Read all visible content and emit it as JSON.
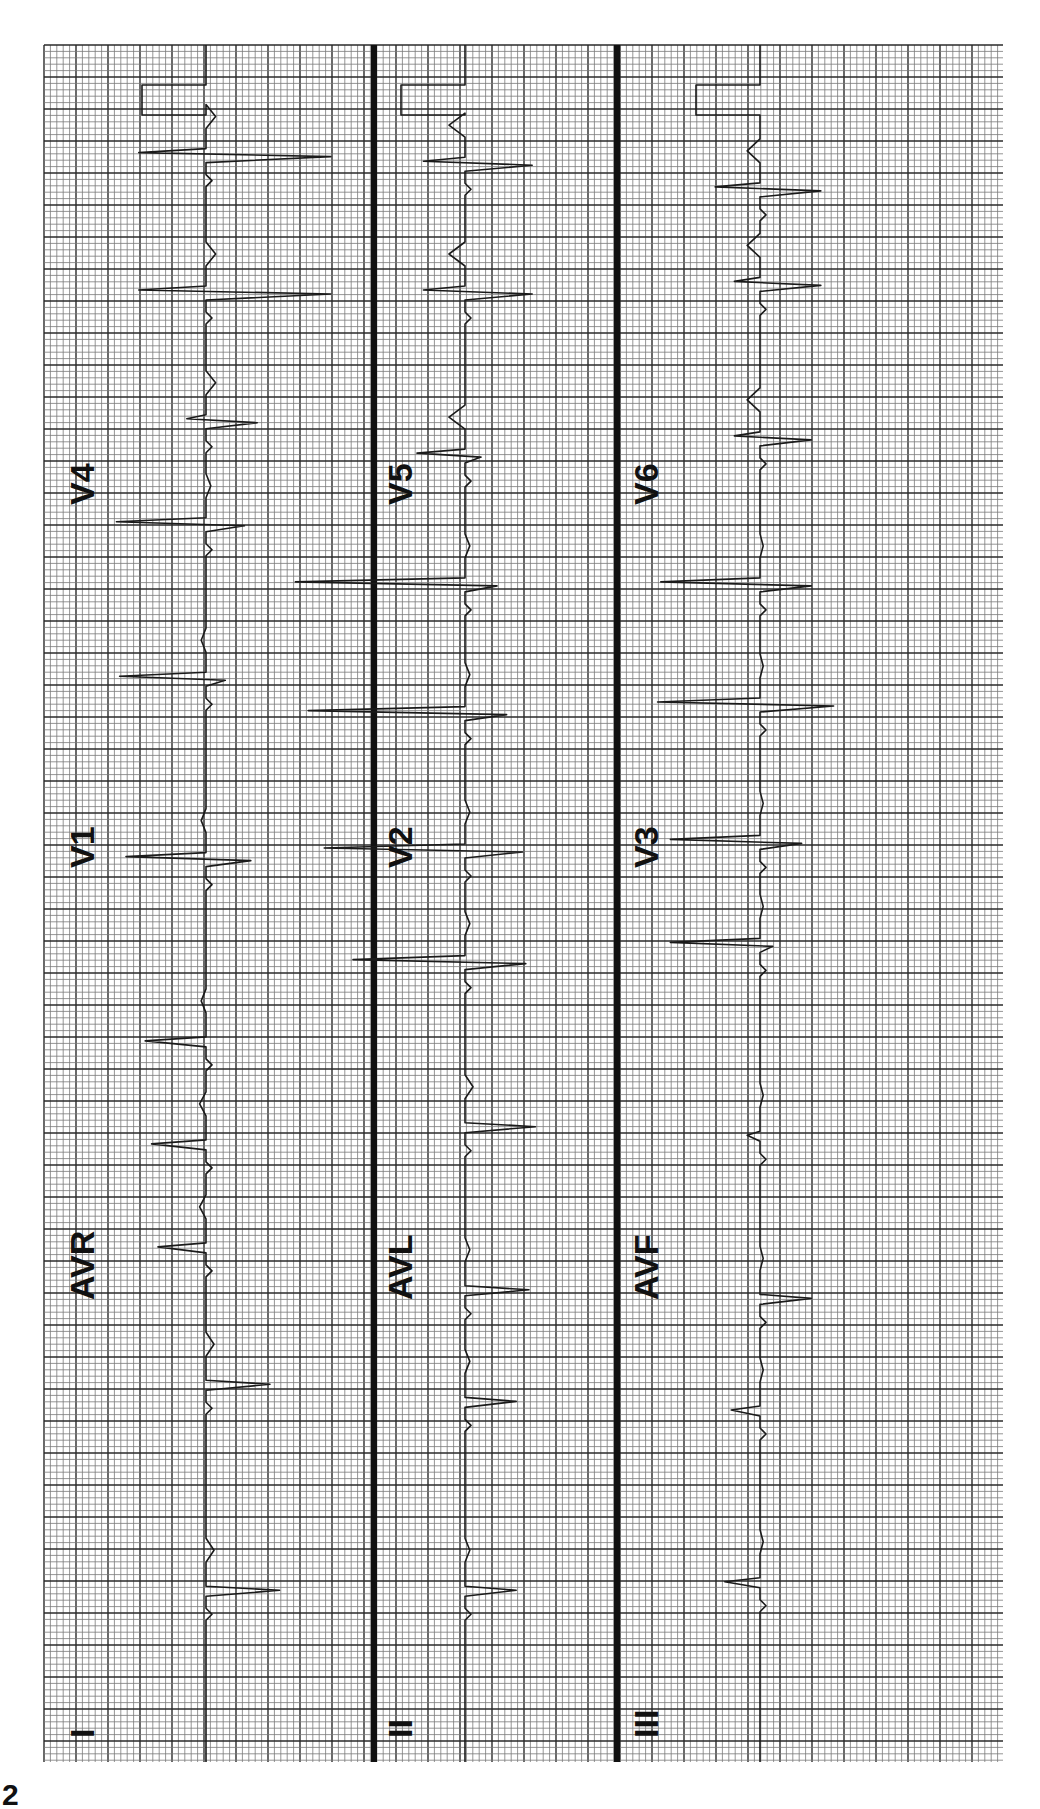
{
  "chart_data": {
    "type": "line",
    "orientation": "rotated 90° counter-clockwise (time runs bottom-to-top)",
    "grid": true,
    "grid_color_minor": "#7a7a7a",
    "grid_color_major": "#2a2a2a",
    "trace_color": "#1a1a1a",
    "divider_color": "#111111",
    "xlabel": "",
    "ylabel": "",
    "time_range_large_boxes": [
      0,
      53
    ],
    "strips": [
      {
        "name": "strip-1",
        "leads": [
          {
            "label": "I",
            "segment": 0
          },
          {
            "label": "AVR",
            "segment": 1
          },
          {
            "label": "V1",
            "segment": 2
          },
          {
            "label": "V4",
            "segment": 3
          }
        ],
        "calibration": {
          "top": true,
          "bottom": true
        },
        "beats": [
          {
            "t": 0.1,
            "r": 2.3,
            "s": 0.0,
            "tw": 0.5
          },
          {
            "t": 0.22,
            "r": 2.0,
            "s": 0.0,
            "tw": 0.5
          },
          {
            "t": 0.3,
            "r": -1.5,
            "s": 0.0,
            "tw": -0.4
          },
          {
            "t": 0.36,
            "r": -1.7,
            "s": 0.0,
            "tw": -0.4
          },
          {
            "t": 0.42,
            "r": -1.9,
            "s": 0.0,
            "tw": -0.3
          },
          {
            "t": 0.525,
            "r": 1.4,
            "s": -2.5,
            "tw": -0.3
          },
          {
            "t": 0.63,
            "r": 0.6,
            "s": -2.7,
            "tw": -0.3
          },
          {
            "t": 0.72,
            "r": 1.2,
            "s": -2.8,
            "tw": 0.3
          },
          {
            "t": 0.78,
            "r": 1.6,
            "s": -0.6,
            "tw": 0.6
          },
          {
            "t": 0.855,
            "r": 3.9,
            "s": -2.1,
            "tw": 0.6
          },
          {
            "t": 0.935,
            "r": 3.9,
            "s": -2.1,
            "tw": 0.6
          }
        ]
      },
      {
        "name": "strip-2",
        "leads": [
          {
            "label": "II",
            "segment": 0
          },
          {
            "label": "AVL",
            "segment": 1
          },
          {
            "label": "V2",
            "segment": 2
          },
          {
            "label": "V5",
            "segment": 3
          }
        ],
        "calibration": {
          "top": true,
          "bottom": true
        },
        "beats": [
          {
            "t": 0.1,
            "r": 1.6,
            "s": 0.0,
            "tw": 0.3
          },
          {
            "t": 0.21,
            "r": 1.6,
            "s": 0.0,
            "tw": 0.3
          },
          {
            "t": 0.275,
            "r": 2.0,
            "s": 0.0,
            "tw": 0.3
          },
          {
            "t": 0.37,
            "r": 2.2,
            "s": 0.0,
            "tw": 0.5
          },
          {
            "t": 0.465,
            "r": 1.9,
            "s": -3.5,
            "tw": 0.3
          },
          {
            "t": 0.53,
            "r": 1.8,
            "s": -4.4,
            "tw": 0.3
          },
          {
            "t": 0.61,
            "r": 1.3,
            "s": -4.9,
            "tw": 0.3
          },
          {
            "t": 0.685,
            "r": 1.0,
            "s": -5.3,
            "tw": 0.3
          },
          {
            "t": 0.76,
            "r": 0.5,
            "s": -1.5,
            "tw": -1.0
          },
          {
            "t": 0.855,
            "r": 2.1,
            "s": -1.3,
            "tw": -1.0
          },
          {
            "t": 0.93,
            "r": 2.1,
            "s": -1.3,
            "tw": -1.0
          }
        ]
      },
      {
        "name": "strip-3",
        "leads": [
          {
            "label": "III",
            "segment": 0
          },
          {
            "label": "AVF",
            "segment": 1
          },
          {
            "label": "V3",
            "segment": 2
          },
          {
            "label": "V6",
            "segment": 3
          }
        ],
        "calibration": {
          "top": true,
          "bottom": true
        },
        "beats": [
          {
            "t": 0.105,
            "r": -1.1,
            "s": 0.0,
            "tw": 0.2
          },
          {
            "t": 0.205,
            "r": -0.9,
            "s": 0.0,
            "tw": 0.2
          },
          {
            "t": 0.27,
            "r": 1.6,
            "s": 0.0,
            "tw": 0.2
          },
          {
            "t": 0.365,
            "r": -0.4,
            "s": 0.0,
            "tw": 0.2
          },
          {
            "t": 0.475,
            "r": 0.4,
            "s": -2.8,
            "tw": 0.2
          },
          {
            "t": 0.535,
            "r": 1.3,
            "s": -2.8,
            "tw": 0.2
          },
          {
            "t": 0.615,
            "r": 2.3,
            "s": -3.2,
            "tw": 0.2
          },
          {
            "t": 0.685,
            "r": 1.6,
            "s": -3.1,
            "tw": 0.2
          },
          {
            "t": 0.77,
            "r": 1.6,
            "s": -0.8,
            "tw": -0.8
          },
          {
            "t": 0.86,
            "r": 1.9,
            "s": -0.8,
            "tw": -0.8
          },
          {
            "t": 0.915,
            "r": 1.9,
            "s": -1.4,
            "tw": -0.8
          }
        ]
      }
    ]
  },
  "corner_mark": "2"
}
